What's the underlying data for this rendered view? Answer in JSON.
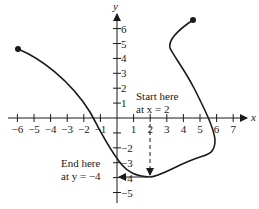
{
  "chart_data": {
    "type": "line",
    "title": "",
    "xlabel": "x",
    "ylabel": "y",
    "xlim": [
      -6,
      7
    ],
    "ylim": [
      -5,
      6
    ],
    "x_ticks": [
      "-6",
      "-5",
      "-4",
      "-3",
      "-2",
      "-1",
      "1",
      "2",
      "3",
      "4",
      "5",
      "6",
      "7"
    ],
    "y_ticks": [
      "6",
      "5",
      "4",
      "3",
      "2",
      "1",
      "-2",
      "-3",
      "-4",
      "-5"
    ],
    "curve_description": "Non-function curve from closed point (-6, 4.5) descending through (-2, 0) to (0, -3.2), minimum near (2, -4), rising to (5.8, -3), then turning up through (5.3, 0) to (3.2, 4.4) and ending at closed point (4.5, 6.1)",
    "endpoints": [
      {
        "x": -6,
        "y": 4.6
      },
      {
        "x": 4.5,
        "y": 6.1
      }
    ],
    "annotations": {
      "start": {
        "line1": "Start here",
        "line2": "at x = 2"
      },
      "end": {
        "line1": "End here",
        "line2": "at y = −4"
      }
    },
    "guide": "Dashed arrow from x = 2 down to the curve at y = −4, then solid arrow left to the y-axis at −4"
  },
  "labels": {
    "x_axis": "x",
    "y_axis": "y",
    "start_line1": "Start here",
    "start_line2": "at x = 2",
    "end_line1": "End here",
    "end_line2": "at y = −4"
  }
}
